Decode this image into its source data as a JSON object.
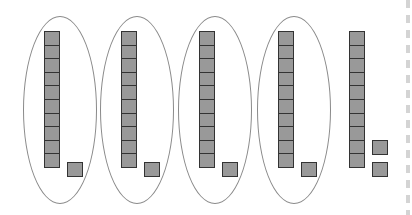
{
  "diagram": {
    "colors": {
      "block_fill": "#999999",
      "block_border": "#333333",
      "ellipse_stroke": "#8a8a8a",
      "dash": "#d4d4d4"
    },
    "groups": [
      {
        "label": "11",
        "tens": 1,
        "ones": 1,
        "circled": true
      },
      {
        "label": "11",
        "tens": 1,
        "ones": 1,
        "circled": true
      },
      {
        "label": "11",
        "tens": 1,
        "ones": 1,
        "circled": true
      },
      {
        "label": "11",
        "tens": 1,
        "ones": 1,
        "circled": true
      },
      {
        "label": "12",
        "tens": 1,
        "ones": 2,
        "circled": false
      }
    ],
    "total": 56
  }
}
